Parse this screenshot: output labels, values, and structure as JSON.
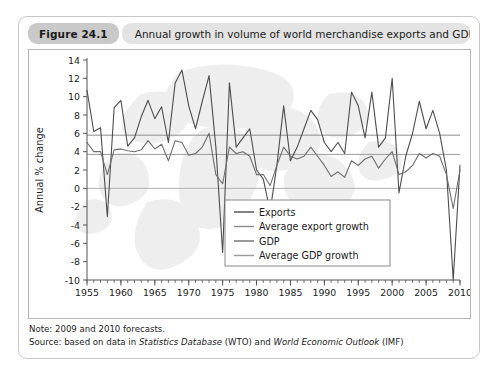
{
  "figure": {
    "number_label": "Figure 24.1",
    "title": "Annual growth in volume of world merchandise exports and GDP",
    "note": "Note: 2009 and 2010 forecasts.",
    "source_prefix": "Source: based on data in ",
    "source_item1": "Statistics Database",
    "source_mid": " (WTO) and ",
    "source_item2": "World Economic Outlook",
    "source_suffix": " (IMF)"
  },
  "colors": {
    "card_border": "#c9c9c9",
    "number_badge_bg": "#c9c9c9",
    "title_bg": "#e3e3e3",
    "plot_border": "#b5b5b5",
    "exports_line": "#4d4d4d",
    "gdp_line": "#6e6e6e",
    "avg_export_line": "#8c8c8c",
    "avg_gdp_line": "#9a9a9a",
    "zero_line": "#b0b0b0",
    "watermark": "#ececec",
    "legend_border": "#8a8a8a",
    "legend_bg": "#ffffff",
    "text": "#1b1b1b"
  },
  "chart_data": {
    "type": "line",
    "title": "Annual growth in volume of world merchandise exports and GDP",
    "xlabel": "",
    "ylabel": "Annual % change",
    "xlim": [
      1955,
      2010
    ],
    "ylim": [
      -10,
      14
    ],
    "ytick_step": 2,
    "yticks": [
      "14",
      "12",
      "10",
      "8",
      "6",
      "4",
      "2",
      "0",
      "-2",
      "-4",
      "-6",
      "-8",
      "-10"
    ],
    "xticks": [
      "1955",
      "1960",
      "1965",
      "1970",
      "1975",
      "1980",
      "1985",
      "1990",
      "1995",
      "2000",
      "2005",
      "2010"
    ],
    "xtick_step": 5,
    "minor_xtick_step": 1,
    "grid": false,
    "legend_position": "lower-right-inside",
    "x": [
      1955,
      1956,
      1957,
      1958,
      1959,
      1960,
      1961,
      1962,
      1963,
      1964,
      1965,
      1966,
      1967,
      1968,
      1969,
      1970,
      1971,
      1972,
      1973,
      1974,
      1975,
      1976,
      1977,
      1978,
      1979,
      1980,
      1981,
      1982,
      1983,
      1984,
      1985,
      1986,
      1987,
      1988,
      1989,
      1990,
      1991,
      1992,
      1993,
      1994,
      1995,
      1996,
      1997,
      1998,
      1999,
      2000,
      2001,
      2002,
      2003,
      2004,
      2005,
      2006,
      2007,
      2008,
      2009,
      2010
    ],
    "series": [
      {
        "name": "Exports",
        "values": [
          10.7,
          6.2,
          6.6,
          -3.1,
          8.8,
          9.6,
          4.6,
          5.5,
          7.8,
          9.6,
          7.6,
          8.9,
          5.0,
          11.5,
          12.9,
          9.0,
          6.5,
          9.5,
          12.3,
          4.5,
          -7.0,
          11.5,
          4.5,
          5.5,
          6.5,
          2.0,
          1.0,
          -2.5,
          2.5,
          9.0,
          3.0,
          4.5,
          6.5,
          8.5,
          7.5,
          5.0,
          4.0,
          5.0,
          3.8,
          10.5,
          9.0,
          5.5,
          10.5,
          4.5,
          5.5,
          12.0,
          -0.5,
          3.5,
          6.0,
          9.5,
          6.5,
          8.5,
          6.0,
          2.0,
          -10.0,
          2.5
        ]
      },
      {
        "name": "GDP",
        "values": [
          5.0,
          4.0,
          4.0,
          1.5,
          4.2,
          4.3,
          4.1,
          4.0,
          4.2,
          5.2,
          4.3,
          4.8,
          3.0,
          5.2,
          5.0,
          3.6,
          3.8,
          4.5,
          6.0,
          1.5,
          0.5,
          4.5,
          3.8,
          4.0,
          3.5,
          1.5,
          1.5,
          0.3,
          2.5,
          4.5,
          3.5,
          3.2,
          3.5,
          4.5,
          3.5,
          2.5,
          1.3,
          1.8,
          1.2,
          3.0,
          2.5,
          3.2,
          3.5,
          2.2,
          3.2,
          4.0,
          1.5,
          1.8,
          2.5,
          3.8,
          3.3,
          3.8,
          3.5,
          1.5,
          -2.2,
          2.0
        ]
      }
    ],
    "reference_lines": [
      {
        "name": "Average export growth",
        "value": 5.8
      },
      {
        "name": "Average GDP growth",
        "value": 3.7
      },
      {
        "name": "Zero line",
        "value": 0
      }
    ],
    "legend": [
      {
        "label": "Exports",
        "color": "#4d4d4d"
      },
      {
        "label": "Average export growth",
        "color": "#8c8c8c"
      },
      {
        "label": "GDP",
        "color": "#6e6e6e"
      },
      {
        "label": "Average GDP growth",
        "color": "#9a9a9a"
      }
    ]
  }
}
